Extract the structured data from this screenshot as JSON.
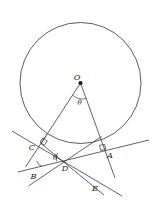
{
  "figure": {
    "type": "geometry-diagram",
    "background_color": "#ffffff",
    "stroke_color": "#3a3a3c",
    "label_color": "#231f20",
    "width": 156,
    "height": 206
  },
  "circle": {
    "name": "main-circle",
    "center_label": "O",
    "center": {
      "x": 80.5,
      "y": 83.0
    },
    "radius": 60.5,
    "stroke": "#4a4a4c",
    "stroke_width": 0.9
  },
  "points": [
    {
      "id": "O",
      "label": "O",
      "x": 80.5,
      "y": 83.0,
      "label_x": 78.5,
      "label_y": 79.0,
      "dot": true
    },
    {
      "id": "C",
      "label": "C",
      "x": 41.0,
      "y": 143.5,
      "label_x": 31.0,
      "label_y": 148.0,
      "dot": false
    },
    {
      "id": "A",
      "label": "A",
      "x": 105.0,
      "y": 150.5,
      "label_x": 107.5,
      "label_y": 158.0,
      "dot": false
    },
    {
      "id": "B",
      "label": "B",
      "x": 34.0,
      "y": 167.5,
      "label_x": 31.0,
      "label_y": 178.0,
      "dot": false
    },
    {
      "id": "D",
      "label": "D",
      "x": 66.5,
      "y": 160.0,
      "label_x": 63.0,
      "label_y": 170.0,
      "dot": false
    },
    {
      "id": "E",
      "label": "E",
      "x": 97.0,
      "y": 181.0,
      "label_x": 93.0,
      "label_y": 190.5,
      "dot": false
    }
  ],
  "angles": [
    {
      "id": "theta-O",
      "label": "θ",
      "label_x": 78.0,
      "label_y": 103.5,
      "at": "O",
      "description": "central angle at O between radii OC and OA"
    },
    {
      "id": "theta-D",
      "label": "θ",
      "label_x": 55.5,
      "label_y": 158.5,
      "at": "D",
      "description": "angle at D equal to central angle theta"
    }
  ],
  "right_angle_marks": [
    {
      "id": "right-angle-C",
      "at": "C",
      "description": "radius OC perpendicular to tangent at C"
    },
    {
      "id": "right-angle-A",
      "at": "A",
      "description": "radius OA perpendicular to tangent at A"
    }
  ],
  "arc_marks": [
    {
      "id": "arc-B",
      "at": "B",
      "description": "angle arc at vertex B"
    },
    {
      "id": "arc-D",
      "at": "D",
      "description": "angle arc at vertex D"
    }
  ],
  "segments": [
    {
      "id": "radius-OC",
      "from": "O",
      "to": "C",
      "description": "radius from center O to tangent point C"
    },
    {
      "id": "radius-OA",
      "from": "O",
      "to": "A",
      "description": "radius from center O to tangent point A"
    }
  ],
  "lines": [
    {
      "id": "tangent-at-C",
      "through": "C",
      "description": "tangent line touching circle at C, extended through B and E"
    },
    {
      "id": "tangent-at-A",
      "through": "A",
      "description": "tangent line touching circle at A, extended through D and B side"
    },
    {
      "id": "secant-BDA",
      "through": "B,D,A",
      "description": "line through B, D and A"
    },
    {
      "id": "line-OCE",
      "through": "O,C,E",
      "description": "line from O through C extended to E"
    }
  ]
}
